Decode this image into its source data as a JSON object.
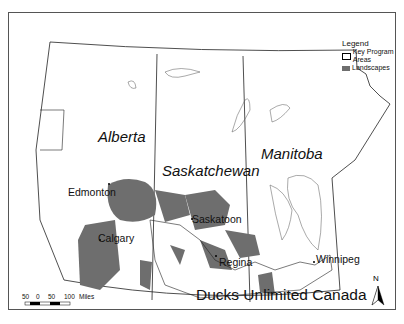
{
  "map": {
    "title": "Ducks Unlimited Canada",
    "provinces": [
      "Alberta",
      "Saskatchewan",
      "Manitoba"
    ],
    "cities": [
      "Edmonton",
      "Calgary",
      "Saskatoon",
      "Regina",
      "Winnipeg"
    ],
    "legend": {
      "heading": "Legend",
      "items": [
        {
          "label": "Key Program Areas",
          "symbol": "outline-polygon"
        },
        {
          "label": "Landscapes",
          "symbol": "filled-gray"
        }
      ]
    },
    "scale_bar": {
      "ticks": [
        "50",
        "0",
        "50",
        "100"
      ],
      "unit": "Miles"
    },
    "north_arrow": "N",
    "colors": {
      "landscape_fill": "#6e6e6e",
      "border": "#222222",
      "lake": "#ffffff"
    }
  }
}
